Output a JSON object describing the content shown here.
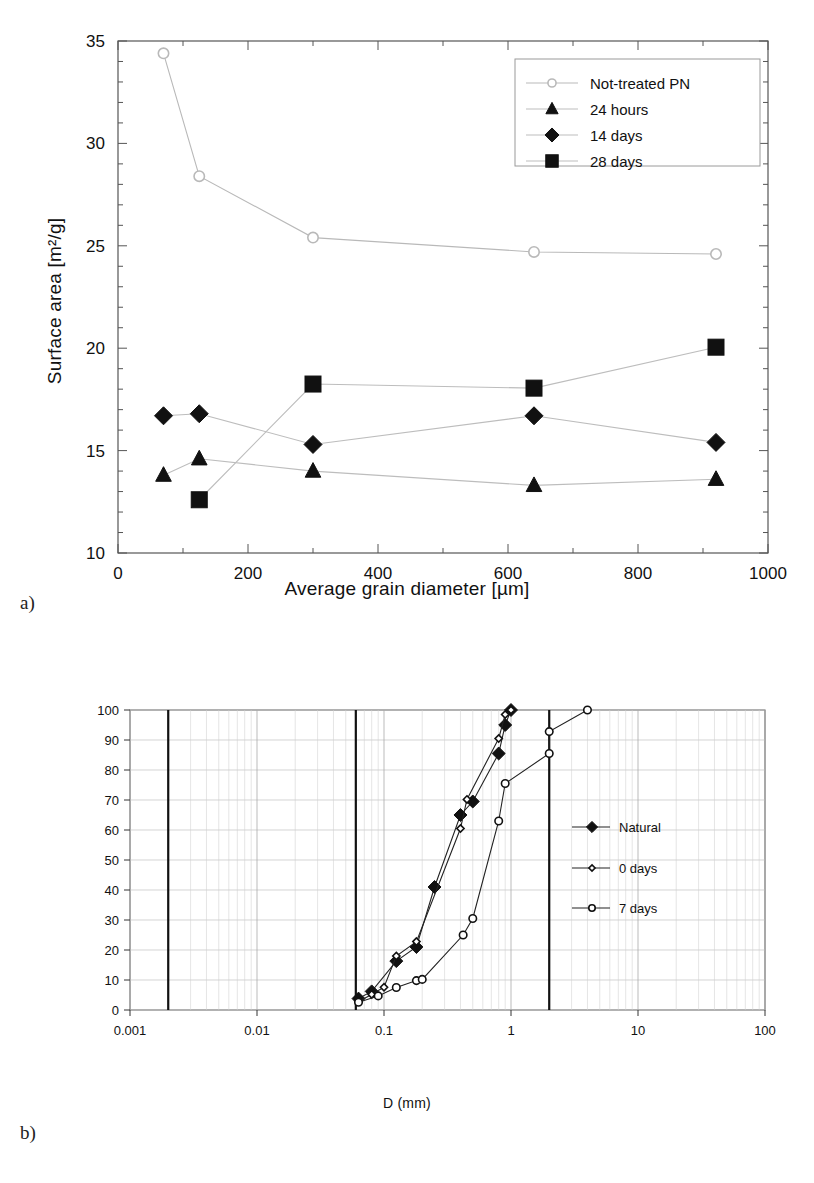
{
  "figure": {
    "panel_a_label": "a)",
    "panel_b_label": "b)"
  },
  "chart_data": [
    {
      "id": "panel_a",
      "type": "line",
      "title": "",
      "xlabel": "Average grain diameter [µm]",
      "ylabel": "Surface area [m²/g]",
      "xlim": [
        0,
        1000
      ],
      "ylim": [
        10,
        35
      ],
      "xticks": [
        0,
        200,
        400,
        600,
        800,
        1000
      ],
      "xtick_labels": [
        "0",
        "200",
        "400",
        "600",
        "800",
        "1000"
      ],
      "yticks": [
        10,
        15,
        20,
        25,
        30,
        35
      ],
      "ytick_labels": [
        "10",
        "15",
        "20",
        "25",
        "30",
        "35"
      ],
      "x_minor_step": 100,
      "y_minor_step": 1,
      "grid": false,
      "legend_position": "upper-right",
      "series": [
        {
          "name": "Not-treated PN",
          "marker": "open-circle",
          "color": "#b9b9b9",
          "x": [
            70,
            125,
            300,
            640,
            920
          ],
          "values": [
            34.4,
            28.4,
            25.4,
            24.7,
            24.6
          ]
        },
        {
          "name": "24 hours",
          "marker": "filled-triangle",
          "color": "#111111",
          "x": [
            70,
            125,
            300,
            640,
            920
          ],
          "values": [
            13.8,
            14.6,
            14.0,
            13.3,
            13.6
          ]
        },
        {
          "name": "14 days",
          "marker": "filled-diamond",
          "color": "#111111",
          "x": [
            70,
            125,
            300,
            640,
            920
          ],
          "values": [
            16.7,
            16.8,
            15.3,
            16.7,
            15.4
          ]
        },
        {
          "name": "28 days",
          "marker": "filled-square",
          "color": "#111111",
          "x": [
            125,
            300,
            640,
            920
          ],
          "values": [
            12.6,
            18.25,
            18.05,
            20.05
          ]
        }
      ]
    },
    {
      "id": "panel_b",
      "type": "line",
      "title": "",
      "xlabel": "D (mm)",
      "ylabel": "P (%)",
      "xscale": "log",
      "xlim": [
        0.001,
        100
      ],
      "ylim": [
        0,
        100
      ],
      "xticks": [
        0.001,
        0.01,
        0.1,
        1,
        10,
        100
      ],
      "xtick_labels": [
        "0.001",
        "0.01",
        "0.1",
        "1",
        "10",
        "100"
      ],
      "yticks": [
        0,
        10,
        20,
        30,
        40,
        50,
        60,
        70,
        80,
        90,
        100
      ],
      "ytick_labels": [
        "0",
        "10",
        "20",
        "30",
        "40",
        "50",
        "60",
        "70",
        "80",
        "90",
        "100"
      ],
      "grid": true,
      "grid_style": "log-minor-vertical-and-horizontal",
      "boundary_lines": [
        0.002,
        0.06,
        2
      ],
      "legend_position": "right-middle",
      "series": [
        {
          "name": "Natural",
          "marker": "filled-diamond",
          "color": "#111111",
          "x": [
            0.063,
            0.08,
            0.125,
            0.18,
            0.25,
            0.4,
            0.5,
            0.8,
            0.9,
            1.0
          ],
          "values": [
            3.8,
            6.2,
            16.3,
            21.0,
            41.0,
            65.0,
            69.5,
            85.5,
            95.0,
            100.0
          ]
        },
        {
          "name": "0 days",
          "marker": "open-diamond",
          "color": "#111111",
          "x": [
            0.063,
            0.08,
            0.1,
            0.125,
            0.18,
            0.4,
            0.45,
            0.8,
            0.9,
            1.0
          ],
          "values": [
            2.8,
            5.2,
            7.6,
            18.0,
            22.8,
            60.5,
            70.2,
            90.5,
            98.5,
            100.0
          ]
        },
        {
          "name": "7 days",
          "marker": "open-circle",
          "color": "#111111",
          "x": [
            0.063,
            0.09,
            0.125,
            0.18,
            0.2,
            0.42,
            0.5,
            0.8,
            0.9,
            2.0,
            2.0,
            4.0
          ],
          "values": [
            2.6,
            4.7,
            7.5,
            9.8,
            10.2,
            25.0,
            30.5,
            63.0,
            75.5,
            85.5,
            92.8,
            100.0
          ]
        }
      ]
    }
  ]
}
